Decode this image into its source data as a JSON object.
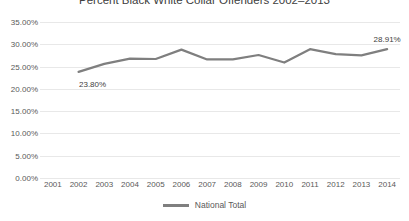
{
  "chart_data": {
    "type": "line",
    "title": "Percent Black White Collar Offenders 2002–2013",
    "xlabel": "",
    "ylabel": "",
    "categories": [
      "2001",
      "2002",
      "2003",
      "2004",
      "2005",
      "2006",
      "2007",
      "2008",
      "2009",
      "2010",
      "2011",
      "2012",
      "2013",
      "2014"
    ],
    "series": [
      {
        "name": "National Total",
        "color": "#7f7f7f",
        "values": [
          null,
          23.8,
          25.6,
          26.8,
          26.7,
          28.8,
          26.6,
          26.6,
          27.6,
          25.9,
          28.9,
          27.8,
          27.5,
          28.91
        ]
      }
    ],
    "ylim": [
      0,
      35
    ],
    "yticks": [
      0,
      5,
      10,
      15,
      20,
      25,
      30,
      35
    ],
    "ytick_labels": [
      "0.00%",
      "5.00%",
      "10.00%",
      "15.00%",
      "20.00%",
      "25.00%",
      "30.00%",
      "35.00%"
    ],
    "grid": true,
    "legend_position": "bottom",
    "point_labels": [
      {
        "category": "2002",
        "text": "23.80%",
        "value": 23.8
      },
      {
        "category": "2014",
        "text": "28.91%",
        "value": 28.91
      }
    ]
  },
  "legend": {
    "entries": [
      {
        "label": "National Total",
        "color": "#7f7f7f"
      }
    ]
  },
  "colors": {
    "series_line": "#7f7f7f",
    "gridline": "#e8e8e8",
    "axis_text": "#595959",
    "title_text": "#404040"
  }
}
